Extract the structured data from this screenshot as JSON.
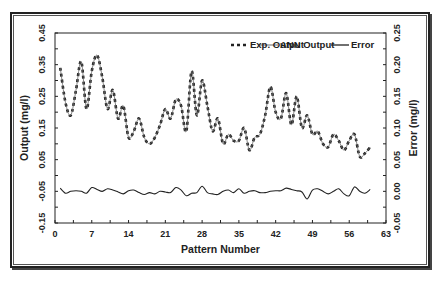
{
  "chart_data": {
    "type": "line",
    "title": "",
    "xlabel": "Pattern Number",
    "ylabel": "Output (mg/l)",
    "ylabel_right": "Error (mg/l)",
    "xlim": [
      0,
      63
    ],
    "ylim": [
      -0.15,
      0.45
    ],
    "ylim_right": [
      -0.05,
      0.25
    ],
    "x_ticks": [
      0,
      7,
      14,
      21,
      28,
      35,
      42,
      49,
      56,
      63
    ],
    "x_tick_labels": [
      "0",
      "7",
      "14",
      "21",
      "28",
      "35",
      "42",
      "49",
      "56",
      "63"
    ],
    "y_ticks": [
      -0.15,
      -0.05,
      0.05,
      0.15,
      0.25,
      0.35,
      0.45
    ],
    "y_tick_labels": [
      "-0.15",
      "-0.05",
      "0.05",
      "0.15",
      "0.25",
      "0.35",
      "0.45"
    ],
    "y_right_ticks": [
      -0.05,
      0.0,
      0.05,
      0.1,
      0.15,
      0.2,
      0.25
    ],
    "y_right_tick_labels": [
      "-0.05",
      "0.00",
      "0.05",
      "0.10",
      "0.15",
      "0.20",
      "0.25"
    ],
    "grid": false,
    "legend_position": "top-right inside",
    "x": [
      1,
      2,
      3,
      4,
      5,
      6,
      7,
      8,
      9,
      10,
      11,
      12,
      13,
      14,
      15,
      16,
      17,
      18,
      19,
      20,
      21,
      22,
      23,
      24,
      25,
      26,
      27,
      28,
      29,
      30,
      31,
      32,
      33,
      34,
      35,
      36,
      37,
      38,
      39,
      40,
      41,
      42,
      43,
      44,
      45,
      46,
      47,
      48,
      49,
      50,
      51,
      52,
      53,
      54,
      55,
      56,
      57,
      58,
      59,
      60
    ],
    "series": [
      {
        "name": "Exp. Output",
        "axis": "left",
        "style": "dashed-thick",
        "values": [
          0.34,
          0.23,
          0.19,
          0.27,
          0.36,
          0.21,
          0.33,
          0.38,
          0.31,
          0.21,
          0.27,
          0.18,
          0.22,
          0.12,
          0.14,
          0.18,
          0.12,
          0.1,
          0.12,
          0.16,
          0.21,
          0.18,
          0.24,
          0.22,
          0.14,
          0.33,
          0.19,
          0.3,
          0.22,
          0.14,
          0.18,
          0.1,
          0.13,
          0.11,
          0.11,
          0.15,
          0.08,
          0.12,
          0.13,
          0.19,
          0.28,
          0.2,
          0.18,
          0.26,
          0.16,
          0.25,
          0.15,
          0.19,
          0.13,
          0.14,
          0.1,
          0.09,
          0.13,
          0.11,
          0.08,
          0.11,
          0.13,
          0.06,
          0.07,
          0.09
        ]
      },
      {
        "name": "ANN Output",
        "axis": "left",
        "style": "solid-thin",
        "values": [
          0.34,
          0.23,
          0.19,
          0.27,
          0.36,
          0.21,
          0.33,
          0.38,
          0.31,
          0.21,
          0.27,
          0.18,
          0.22,
          0.12,
          0.14,
          0.18,
          0.12,
          0.1,
          0.12,
          0.16,
          0.21,
          0.18,
          0.24,
          0.22,
          0.14,
          0.33,
          0.19,
          0.3,
          0.22,
          0.14,
          0.18,
          0.1,
          0.13,
          0.11,
          0.11,
          0.15,
          0.08,
          0.12,
          0.13,
          0.19,
          0.28,
          0.2,
          0.18,
          0.26,
          0.16,
          0.25,
          0.15,
          0.19,
          0.13,
          0.14,
          0.1,
          0.09,
          0.13,
          0.11,
          0.08,
          0.11,
          0.13,
          0.06,
          0.07,
          0.09
        ]
      },
      {
        "name": "Error",
        "axis": "right",
        "style": "solid",
        "values": [
          0.005,
          -0.003,
          0.0,
          0.001,
          0.0,
          -0.003,
          0.006,
          0.003,
          0.0,
          0.004,
          0.002,
          -0.001,
          -0.004,
          0.001,
          0.002,
          -0.002,
          -0.005,
          -0.002,
          -0.004,
          0.0,
          -0.001,
          -0.002,
          0.006,
          0.002,
          -0.007,
          -0.003,
          -0.002,
          0.008,
          -0.002,
          -0.004,
          -0.005,
          0.0,
          0.002,
          -0.002,
          0.004,
          -0.003,
          0.0,
          0.001,
          -0.002,
          -0.002,
          0.0,
          0.001,
          0.001,
          0.005,
          0.003,
          0.001,
          -0.001,
          -0.012,
          0.002,
          0.004,
          0.0,
          -0.004,
          0.0,
          0.004,
          -0.004,
          -0.007,
          0.007,
          0.0,
          -0.003,
          0.003
        ]
      }
    ]
  },
  "legend": {
    "items": [
      {
        "label": "Exp. Output",
        "style": "dashed"
      },
      {
        "label": "ANN Output",
        "style": "thin"
      },
      {
        "label": "Error",
        "style": "solid"
      }
    ]
  },
  "colors": {
    "line": "#222222",
    "frame": "#222222",
    "background": "#ffffff"
  }
}
